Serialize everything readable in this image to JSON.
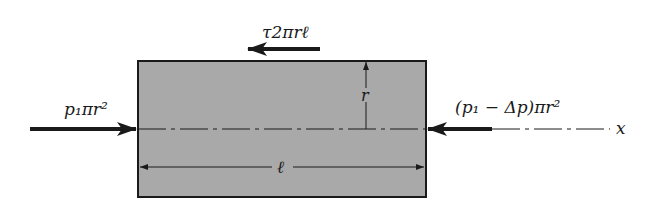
{
  "diagram": {
    "type": "free-body diagram of cylindrical fluid element in pipe flow",
    "colors": {
      "element_fill": "#a9a9a9",
      "stroke": "#1a1a1a",
      "background": "#ffffff"
    },
    "labels": {
      "shear_force": "τ2πrℓ",
      "left_pressure_force": "p₁πr²",
      "right_pressure_force": "(p₁ − Δp)πr²",
      "radius": "r",
      "length": "ℓ",
      "axis": "x"
    },
    "arrows": [
      {
        "name": "shear-force-arrow",
        "direction": "left",
        "label_ref": "shear_force"
      },
      {
        "name": "left-pressure-arrow",
        "direction": "right",
        "label_ref": "left_pressure_force"
      },
      {
        "name": "right-pressure-arrow",
        "direction": "left",
        "label_ref": "right_pressure_force"
      },
      {
        "name": "radius-dimension",
        "direction": "up",
        "label_ref": "radius"
      },
      {
        "name": "length-dimension",
        "direction": "both",
        "label_ref": "length"
      }
    ]
  }
}
